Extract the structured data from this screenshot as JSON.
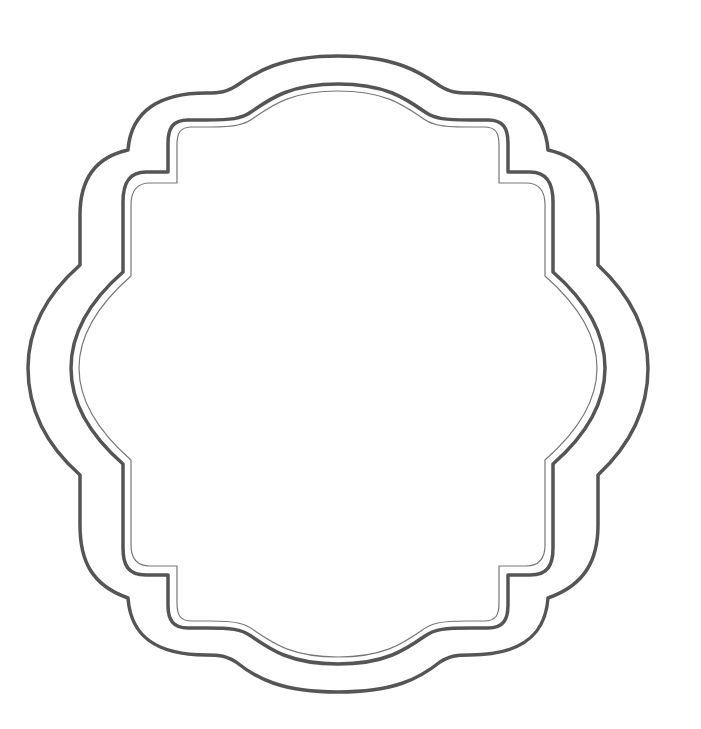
{
  "artwork": {
    "title": "Decorative scalloped frame outline",
    "description": "Three concentric ornamental frame outlines (two thick dark strokes and one thin inner stroke) on a white background",
    "colors": {
      "background": "#ffffff",
      "outer_stroke": "#555555",
      "middle_stroke": "#555555",
      "inner_stroke": "#777777"
    },
    "layers": [
      {
        "name": "outer-frame",
        "stroke_width": 3.5
      },
      {
        "name": "middle-frame",
        "stroke_width": 3.5
      },
      {
        "name": "inner-frame",
        "stroke_width": 1.2
      }
    ]
  }
}
